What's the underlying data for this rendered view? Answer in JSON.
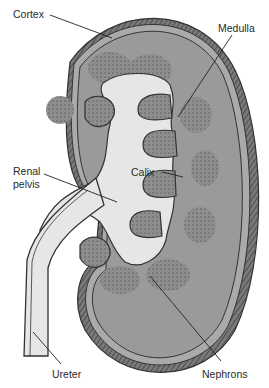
{
  "diagram": {
    "labels": {
      "cortex": "Cortex",
      "medulla": "Medulla",
      "renal_pelvis_line1": "Renal",
      "renal_pelvis_line2": "pelvis",
      "calix": "Calix",
      "ureter": "Ureter",
      "nephrons": "Nephrons"
    },
    "colors": {
      "capsule": "#6e6e6e",
      "cortex": "#9a9a9a",
      "medulla": "#8c8c8c",
      "pelvis": "#e6e6e6",
      "outline": "#333333",
      "background": "#ffffff"
    }
  }
}
